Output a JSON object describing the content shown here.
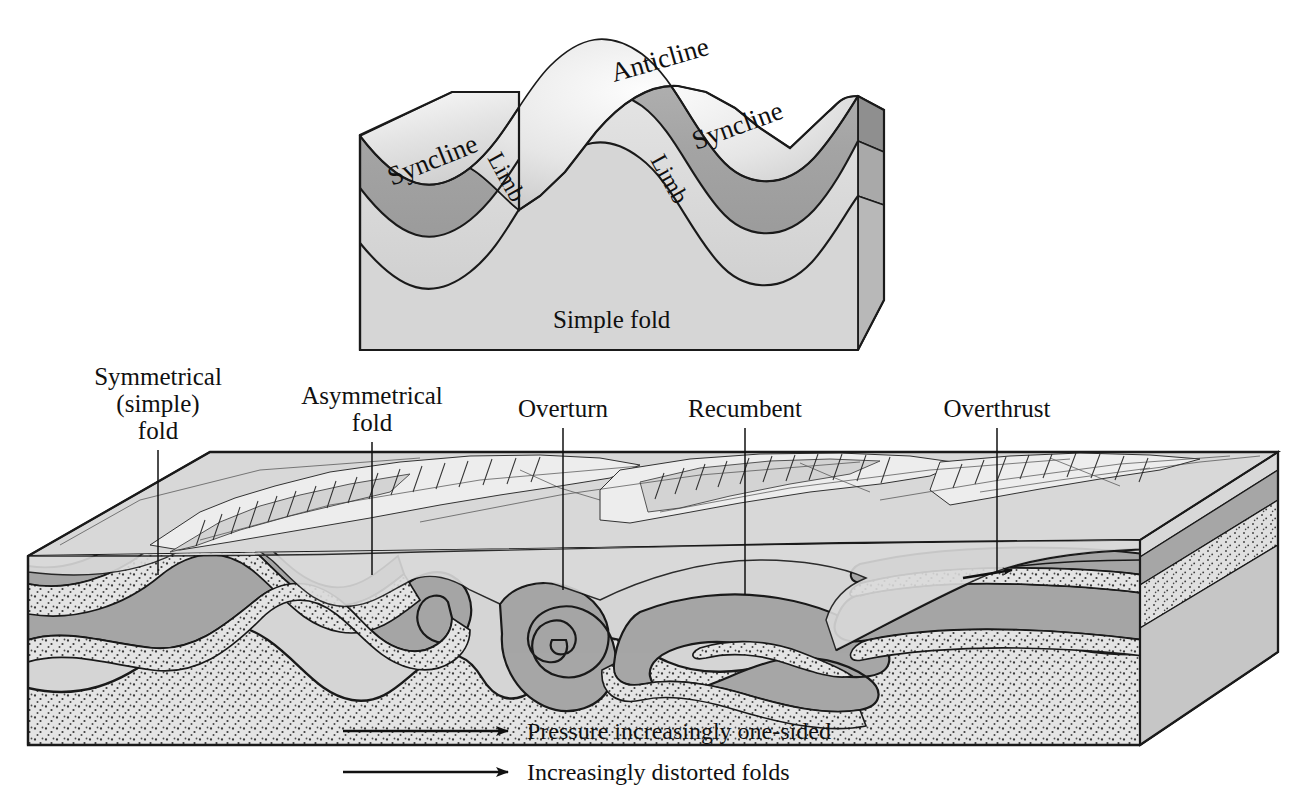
{
  "figure": {
    "type": "geology-block-diagram",
    "title_text_present": false,
    "background_color": "#ffffff",
    "line_color": "#1a1a1a"
  },
  "palette": {
    "stroke": "#1a1a1a",
    "layer_dark_gray": "#a8a8a8",
    "layer_mid_gray": "#bdbdbd",
    "layer_light_gray": "#d4d4d4",
    "layer_pale_gray": "#dcdcdc",
    "layer_stipple_base": "#e2e2e2",
    "side_face_dark": "#9a9a9a",
    "side_face_mid": "#b4b4b4",
    "terrain_light": "#ececec",
    "terrain_shadow": "#bcbcbc",
    "highlight_white": "#f7f7f7"
  },
  "top_block": {
    "name": "simple-fold-block",
    "caption": "Simple fold",
    "labels": [
      {
        "id": "syncline-left",
        "text": "Syncline",
        "x": 392,
        "y": 168,
        "rotate": -20
      },
      {
        "id": "limb-left",
        "text": "Limb",
        "x": 487,
        "y": 172,
        "rotate": 62
      },
      {
        "id": "anticline",
        "text": "Anticline",
        "x": 612,
        "y": 66,
        "rotate": -12
      },
      {
        "id": "limb-right",
        "text": "Limb",
        "x": 655,
        "y": 175,
        "rotate": 62
      },
      {
        "id": "syncline-right",
        "text": "Syncline",
        "x": 700,
        "y": 164,
        "rotate": -20
      }
    ],
    "caption_position": {
      "x": 553,
      "y": 325
    },
    "layers": [
      {
        "id": "upper-unit",
        "tone": "dark-gray"
      },
      {
        "id": "middle-unit",
        "tone": "light-gray"
      },
      {
        "id": "lower-unit",
        "tone": "pale-gray"
      }
    ]
  },
  "bottom_block": {
    "name": "progressive-deformation-block",
    "callouts": [
      {
        "id": "symmetrical-fold",
        "lines": [
          "Symmetrical",
          "(simple)",
          "fold"
        ],
        "text_x": 158,
        "text_y": 379,
        "leader_x": 158,
        "leader_y1": 424,
        "leader_y2": 573
      },
      {
        "id": "asymmetrical-fold",
        "lines": [
          "Asymmetrical",
          "fold"
        ],
        "text_x": 372,
        "text_y": 400,
        "leader_x": 372,
        "leader_y1": 424,
        "leader_y2": 573
      },
      {
        "id": "overturn",
        "lines": [
          "Overturn"
        ],
        "text_x": 563,
        "text_y": 413,
        "leader_x": 563,
        "leader_y1": 424,
        "leader_y2": 585
      },
      {
        "id": "recumbent",
        "lines": [
          "Recumbent"
        ],
        "text_x": 745,
        "text_y": 413,
        "leader_x": 745,
        "leader_y1": 424,
        "leader_y2": 590
      },
      {
        "id": "overthrust",
        "lines": [
          "Overthrust"
        ],
        "text_x": 997,
        "text_y": 413,
        "leader_x": 997,
        "leader_y1": 424,
        "leader_y2": 570
      }
    ],
    "fold_sequence": [
      "Symmetrical (simple) fold",
      "Asymmetrical fold",
      "Overturn",
      "Recumbent",
      "Overthrust"
    ],
    "thrust_fault_arrow": {
      "present": true,
      "direction": "right",
      "x": 1005,
      "y": 571
    }
  },
  "arrows": [
    {
      "id": "pressure-arrow",
      "caption": "Pressure increasing|y one-sided",
      "label": "Pressure increasingly one-sided",
      "x1": 343,
      "x2": 513,
      "y": 731,
      "text_x": 527,
      "text_y": 738
    },
    {
      "id": "distortion-arrow",
      "label": "Increasingly distorted folds",
      "x1": 343,
      "x2": 513,
      "y": 772,
      "text_x": 527,
      "text_y": 779
    }
  ]
}
